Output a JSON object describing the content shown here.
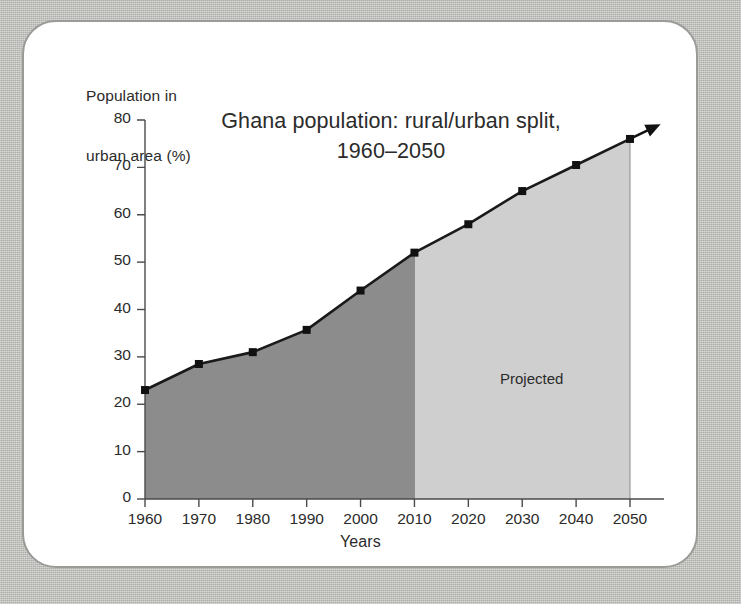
{
  "card": {
    "background_color": "#ffffff",
    "border_color": "#9a9a97",
    "page_background_color": "#bfbfbc"
  },
  "chart_data": {
    "type": "area",
    "title": "Ghana population: rural/urban split,\n1960–2050",
    "title_line1": "Ghana population: rural/urban split,",
    "title_line2": "1960–2050",
    "xlabel": "Years",
    "ylabel": "Population in\nurban area (%)",
    "ylabel_line1": "Population in",
    "ylabel_line2": "urban area (%)",
    "categories": [
      1960,
      1970,
      1980,
      1990,
      2000,
      2010,
      2020,
      2030,
      2040,
      2050
    ],
    "x_tick_labels": [
      "1960",
      "1970",
      "1980",
      "1990",
      "2000",
      "2010",
      "2020",
      "2030",
      "2040",
      "2050"
    ],
    "values": [
      23,
      28.5,
      31,
      35.7,
      44,
      52,
      58,
      65,
      70.5,
      76
    ],
    "ylim": [
      0,
      80
    ],
    "y_ticks": [
      0,
      10,
      20,
      30,
      40,
      50,
      60,
      70,
      80
    ],
    "y_tick_labels": [
      "0",
      "10",
      "20",
      "30",
      "40",
      "50",
      "60",
      "70",
      "80"
    ],
    "xlim": [
      1960,
      2050
    ],
    "grid": false,
    "legend": false,
    "annotations": [
      {
        "text": "Projected",
        "x": 2027,
        "y": 30
      }
    ],
    "series": [
      {
        "name": "Historical",
        "x_range": [
          1960,
          2010
        ],
        "fill_color": "#8c8c8c",
        "line_color": "#1a1a1a"
      },
      {
        "name": "Projected",
        "x_range": [
          2010,
          2050
        ],
        "fill_color": "#cfcfcf",
        "line_color": "#1a1a1a"
      }
    ],
    "marker_shape": "square",
    "marker_color": "#111111",
    "axis_color": "#4a4a4a",
    "arrow_at_end": true
  }
}
